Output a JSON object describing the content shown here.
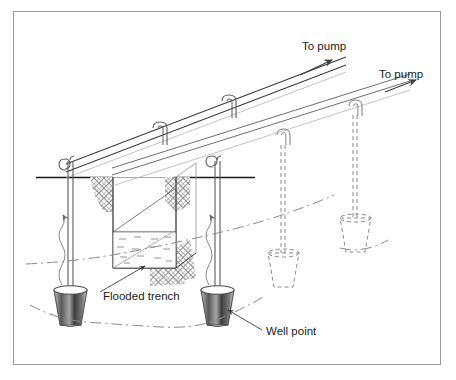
{
  "figure": {
    "background_color": "#ffffff",
    "frame_color": "#9a9a9a",
    "line_color": "#3d3d3d",
    "dark_line_color": "#1a1a1a",
    "hatch_color": "#8c8c8c",
    "water_color": "#6f6f6f"
  },
  "labels": {
    "to_pump_left": "To pump",
    "to_pump_right": "To pump",
    "flooded_trench": "Flooded trench",
    "well_point": "Well point"
  },
  "icons": {
    "arrow_left_pump": "arrow-to-pump-icon",
    "arrow_right_pump": "arrow-to-pump-icon",
    "flow_arrow": "water-flow-arrow-icon",
    "leader_trench": "leader-line-icon",
    "leader_wellpoint": "leader-line-icon"
  },
  "components": {
    "header_pipes": [
      {
        "name": "front-header-pipe",
        "riser_count": 2,
        "style": "solid"
      },
      {
        "name": "rear-header-pipe",
        "riser_count": 2,
        "style": "dashed"
      }
    ],
    "swing_connectors_front": 2,
    "swing_connectors_rear": 2,
    "hook_connectors_front": 2,
    "well_points_visible": 2,
    "well_points_hidden": 2,
    "ground_line": "ground-surface",
    "drawdown_curve": "lowered-water-table"
  }
}
